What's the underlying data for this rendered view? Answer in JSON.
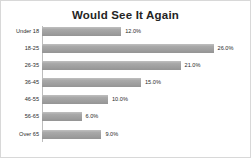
{
  "chart_data": {
    "type": "bar",
    "orientation": "horizontal",
    "title": "Would See It Again",
    "xlabel": "",
    "ylabel": "",
    "xlim": [
      0,
      30
    ],
    "grid": false,
    "legend": false,
    "value_suffix": "%",
    "bar_color": "#a5a5a5",
    "categories": [
      "Under 18",
      "18-25",
      "26-35",
      "36-45",
      "46-55",
      "56-65",
      "Over 65"
    ],
    "values": [
      12.0,
      26.0,
      21.0,
      15.0,
      10.0,
      6.0,
      9.0
    ],
    "value_labels": [
      "12.0%",
      "26.0%",
      "21.0%",
      "15.0%",
      "10.0%",
      "6.0%",
      "9.0%"
    ]
  }
}
